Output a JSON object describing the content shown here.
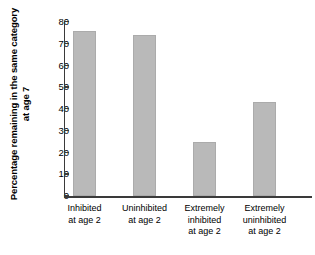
{
  "chart_data": {
    "type": "bar",
    "title": "",
    "xlabel": "",
    "ylabel": "Percentage remaining in the same category at age 7",
    "categories": [
      "Inhibited at age 2",
      "Uninhibited at age 2",
      "Extremely inhibited at age 2",
      "Extremely uninhibited at age 2"
    ],
    "category_lines": [
      [
        "Inhibited",
        "at age 2"
      ],
      [
        "Uninhibited",
        "at age 2"
      ],
      [
        "Extremely",
        "inhibited",
        "at age 2"
      ],
      [
        "Extremely",
        "uninhibited",
        "at age 2"
      ]
    ],
    "values": [
      76,
      74,
      25,
      43
    ],
    "ylim": [
      0,
      80
    ],
    "yticks": [
      0,
      10,
      20,
      30,
      40,
      50,
      60,
      70,
      80
    ],
    "ytick_labels": [
      "0",
      "10",
      "20",
      "30",
      "40",
      "50",
      "60",
      "70",
      "80"
    ],
    "grid": false,
    "legend": null,
    "bar_color": "#b9b9b9",
    "axis_color": "#3a3a3a",
    "background": "#ffffff"
  }
}
